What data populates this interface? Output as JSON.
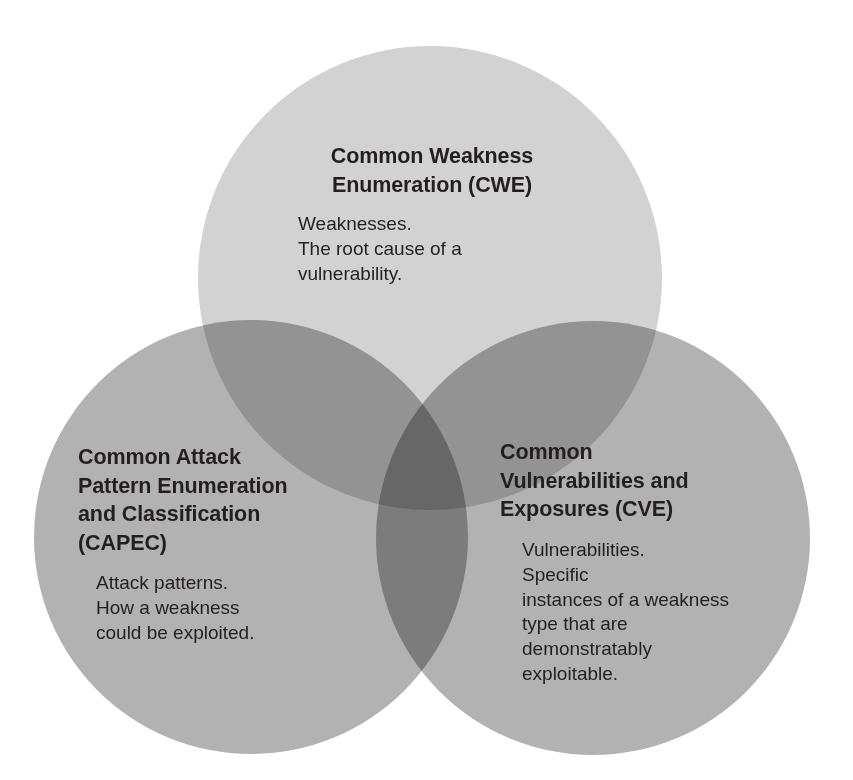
{
  "diagram": {
    "type": "venn",
    "set_count": 3,
    "background_color": "#ffffff",
    "colors": {
      "top_circle_fill": "#d2d2d2",
      "bottom_circle_fill": "#b5b5b5",
      "two_way_overlap": "#9a9a9a",
      "three_way_overlap": "#8a8a8a",
      "text_color": "#231f20"
    },
    "circles": [
      {
        "id": "cwe",
        "cx": 430,
        "cy": 278,
        "r": 232,
        "fill": "#d2d2d2"
      },
      {
        "id": "capec",
        "cx": 251,
        "cy": 537,
        "r": 217,
        "fill": "#b2b2b2"
      },
      {
        "id": "cve",
        "cx": 593,
        "cy": 538,
        "r": 217,
        "fill": "#b2b2b2"
      }
    ],
    "sets": [
      {
        "id": "cwe",
        "acronym": "CWE",
        "title": "Common Weakness\nEnumeration (CWE)",
        "body": "Weaknesses.\n        The root cause of a\nvulnerability."
      },
      {
        "id": "capec",
        "acronym": "CAPEC",
        "title": "Common Attack\nPattern Enumeration\nand Classification\n(CAPEC)",
        "body": "Attack patterns.\n        How a weakness\ncould be exploited."
      },
      {
        "id": "cve",
        "acronym": "CVE",
        "title": "Common\nVulnerabilities and\nExposures (CVE)",
        "body": "Vulnerabilities.\n        Specific\ninstances of a weakness\ntype that are\ndemonstratably\nexploitable."
      }
    ]
  }
}
